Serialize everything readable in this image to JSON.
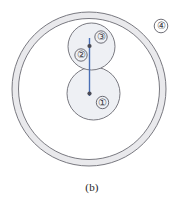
{
  "figure": {
    "caption": "(b)",
    "background_color": "#ffffff",
    "labels": {
      "item1": "①",
      "item2": "②",
      "item3": "③",
      "item4": "④"
    },
    "colors": {
      "outline": "#6b6b73",
      "ring_fill": "#e9e9ec",
      "circle_fill": "#eef0f4",
      "connector": "#4a6fb5",
      "center_dot": "#4b4b55",
      "label_text": "#3a3a42"
    }
  },
  "chart_data": {
    "type": "diagram",
    "title": "(b)",
    "shapes": [
      {
        "id": "outer-ring",
        "label": "④",
        "role": "outer-annulus",
        "kind": "annulus",
        "cx": 89,
        "cy": 89,
        "outer_r": 77,
        "inner_r": 70.5,
        "fill": "#e9e9ec",
        "stroke": "#6b6b73"
      },
      {
        "id": "upper-circle",
        "label": "②",
        "role": "upper-interior-circle",
        "kind": "circle",
        "cx": 91.5,
        "cy": 46.5,
        "r": 23.5,
        "fill": "#eef0f4",
        "stroke": "#6b6b73"
      },
      {
        "id": "lower-circle",
        "label": "①",
        "role": "lower-interior-circle",
        "kind": "circle",
        "cx": 93.5,
        "cy": 93.5,
        "r": 26.5,
        "fill": "#eef0f4",
        "stroke": "#6b6b73"
      }
    ],
    "points": [
      {
        "id": "upper-center",
        "x": 89.5,
        "y": 46.0,
        "r": 2.1,
        "color": "#4b4b55"
      },
      {
        "id": "lower-center",
        "x": 89.5,
        "y": 93.5,
        "r": 2.1,
        "color": "#4b4b55"
      }
    ],
    "connector": {
      "id": "center-connector",
      "x1": 89.5,
      "y1": 38.0,
      "x2": 89.5,
      "y2": 96.0,
      "color": "#4a6fb5",
      "width": 1.4
    },
    "annotations": [
      {
        "label": "①",
        "x": 102.5,
        "y": 102.5,
        "circled": true,
        "attached_to": "lower-circle"
      },
      {
        "label": "②",
        "x": 81.0,
        "y": 55.0,
        "circled": true,
        "attached_to": "upper-circle"
      },
      {
        "label": "③",
        "x": 101.0,
        "y": 37.0,
        "circled": true,
        "attached_to": "upper-circle"
      },
      {
        "label": "④",
        "x": 161.0,
        "y": 26.0,
        "circled": true,
        "attached_to": "outer-ring"
      }
    ]
  }
}
